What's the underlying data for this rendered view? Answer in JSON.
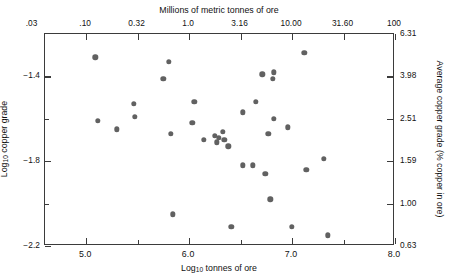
{
  "chart_data": {
    "type": "scatter",
    "title": "",
    "xlabel": "Log10 tonnes of ore",
    "ylabel": "Log10 copper grade",
    "x2label": "Millions of metric tonnes of ore",
    "y2label": "Average copper grade (% copper in ore)",
    "xlim": [
      4.6,
      8.0
    ],
    "ylim": [
      -2.2,
      -1.2
    ],
    "grid": false,
    "legend": null,
    "marker": "filled-circle",
    "marker_color": "#616161",
    "x_ticks": [
      "5.0",
      "6.0",
      "7.0",
      "8.0"
    ],
    "x_tick_values": [
      5.0,
      6.0,
      7.0,
      8.0
    ],
    "x2_ticks": [
      ".03",
      ".10",
      "0.32",
      "1.0",
      "3.16",
      "10.00",
      "31.60",
      "100"
    ],
    "x2_tick_values": [
      4.48,
      5.0,
      5.5,
      6.0,
      6.5,
      7.0,
      7.5,
      8.0
    ],
    "y_ticks": [
      "-1.4",
      "-1.8",
      "-2.2"
    ],
    "y_tick_values": [
      -1.4,
      -1.8,
      -2.2
    ],
    "y_minor_values": [
      -1.6,
      -2.0
    ],
    "y2_ticks": [
      "6.31",
      "3.98",
      "2.51",
      "1.59",
      "1.00",
      "0.63"
    ],
    "y2_tick_values": [
      -1.2,
      -1.4,
      -1.6,
      -1.8,
      -2.0,
      -2.2
    ],
    "points": [
      {
        "x": 5.09,
        "y": -1.31
      },
      {
        "x": 5.46,
        "y": -1.53
      },
      {
        "x": 5.47,
        "y": -1.59
      },
      {
        "x": 5.11,
        "y": -1.61
      },
      {
        "x": 5.3,
        "y": -1.65
      },
      {
        "x": 5.8,
        "y": -1.33
      },
      {
        "x": 5.75,
        "y": -1.41
      },
      {
        "x": 6.05,
        "y": -1.52
      },
      {
        "x": 6.03,
        "y": -1.62
      },
      {
        "x": 5.82,
        "y": -1.67
      },
      {
        "x": 6.27,
        "y": -1.71
      },
      {
        "x": 6.29,
        "y": -1.69
      },
      {
        "x": 7.12,
        "y": -1.29
      },
      {
        "x": 6.71,
        "y": -1.39
      },
      {
        "x": 6.82,
        "y": -1.38
      },
      {
        "x": 6.81,
        "y": -1.41
      },
      {
        "x": 6.65,
        "y": -1.52
      },
      {
        "x": 6.52,
        "y": -1.57
      },
      {
        "x": 6.33,
        "y": -1.66
      },
      {
        "x": 6.14,
        "y": -1.7
      },
      {
        "x": 6.82,
        "y": -1.6
      },
      {
        "x": 6.25,
        "y": -1.68
      },
      {
        "x": 6.34,
        "y": -1.7
      },
      {
        "x": 6.38,
        "y": -1.73
      },
      {
        "x": 6.52,
        "y": -1.82
      },
      {
        "x": 6.62,
        "y": -1.82
      },
      {
        "x": 6.77,
        "y": -1.67
      },
      {
        "x": 6.96,
        "y": -1.64
      },
      {
        "x": 6.74,
        "y": -1.86
      },
      {
        "x": 6.79,
        "y": -1.98
      },
      {
        "x": 7.31,
        "y": -1.79
      },
      {
        "x": 7.14,
        "y": -1.84
      },
      {
        "x": 5.84,
        "y": -2.05
      },
      {
        "x": 6.41,
        "y": -2.11
      },
      {
        "x": 7.0,
        "y": -2.11
      },
      {
        "x": 7.35,
        "y": -2.15
      }
    ]
  },
  "axes": {
    "top_title": "Millions of metric tonnes of ore",
    "bottom_title_prefix": "Log",
    "bottom_title_sub": "10",
    "bottom_title_suffix": " tonnes of ore",
    "left_title_prefix": "Log",
    "left_title_sub": "10",
    "left_title_suffix": " copper grade",
    "right_title": "Average copper grade (% copper in ore)"
  }
}
